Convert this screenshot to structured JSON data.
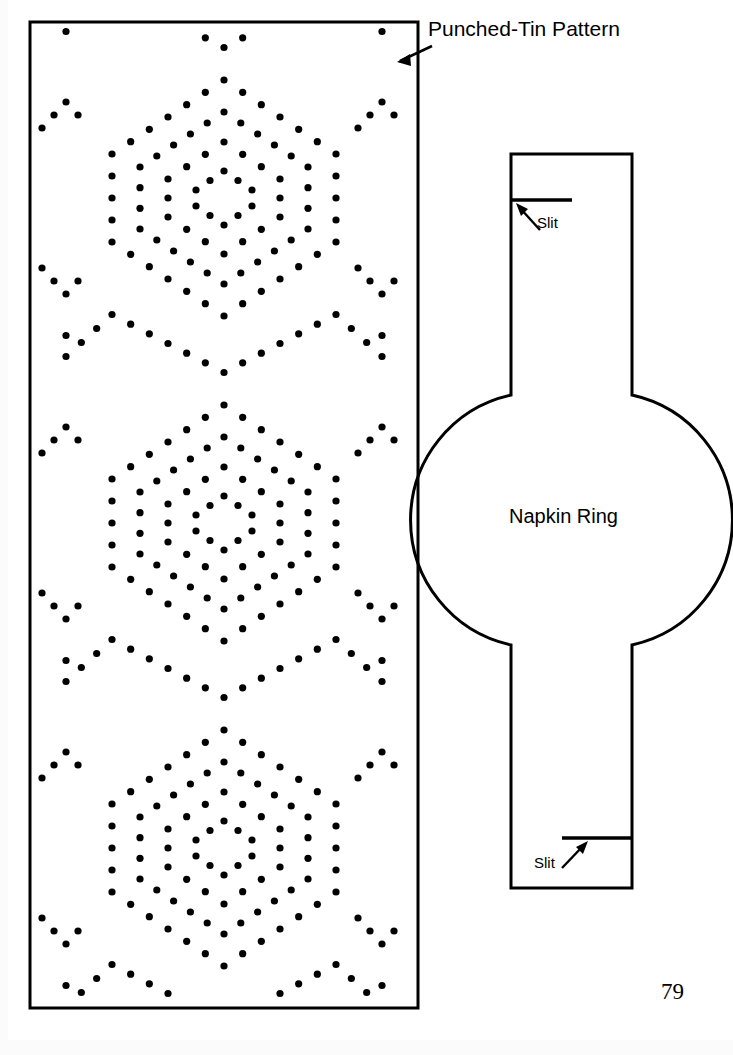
{
  "page": {
    "width": 733,
    "height": 1055,
    "background": "#ffffff",
    "ink_color": "#000000",
    "page_number": "79"
  },
  "labels": {
    "pattern_label": "Punched-Tin Pattern",
    "ring_label": "Napkin Ring",
    "slit_top_label": "Slit",
    "slit_bottom_label": "Slit"
  },
  "pattern_panel": {
    "name": "punched-tin-pattern-panel",
    "rect": {
      "x": 30,
      "y": 22,
      "width": 388,
      "height": 986
    },
    "stroke_width": 3,
    "dot_radius": 3.6,
    "dot_color": "#000000",
    "motif": {
      "description": "nested hexagonal dot outlines repeating vertically",
      "repeat_count": 3,
      "period_y": 325,
      "first_center_y": 198,
      "center_x": 224,
      "hexagons": [
        {
          "half_width": 112,
          "side_height": 88,
          "cap_height": 74,
          "dot_spacing": 22
        },
        {
          "half_width": 84,
          "side_height": 62,
          "cap_height": 55,
          "dot_spacing": 21
        },
        {
          "half_width": 56,
          "side_height": 38,
          "cap_height": 37,
          "dot_spacing": 20
        },
        {
          "half_width": 28,
          "side_height": 16,
          "cap_height": 19,
          "dot_spacing": 19
        }
      ]
    }
  },
  "napkin_ring": {
    "name": "napkin-ring-template",
    "stroke_width": 3,
    "band": {
      "left_x": 511,
      "right_x": 632,
      "top_y": 154,
      "bottom_y": 888
    },
    "circle": {
      "cx": 570,
      "cy": 520,
      "r": 128
    },
    "tangent_top_y": 395,
    "tangent_bottom_y": 645,
    "slits": [
      {
        "id": "slit-top",
        "x1": 511,
        "x2": 572,
        "y": 200,
        "from_edge": "left"
      },
      {
        "id": "slit-bottom",
        "x1": 562,
        "x2": 632,
        "y": 838,
        "from_edge": "right"
      }
    ],
    "arrows": [
      {
        "id": "slit-top-arrow",
        "tail_x": 540,
        "tail_y": 230,
        "head_x": 517,
        "head_y": 205
      },
      {
        "id": "slit-bottom-arrow",
        "tail_x": 562,
        "tail_y": 868,
        "head_x": 587,
        "head_y": 843
      }
    ]
  },
  "pattern_callout": {
    "name": "pattern-callout-arrow",
    "tail_x": 432,
    "tail_y": 46,
    "head_x": 397,
    "head_y": 62
  }
}
